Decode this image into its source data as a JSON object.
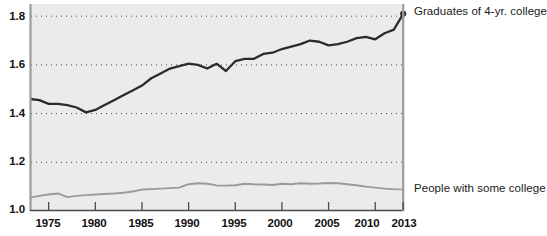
{
  "chart_data": {
    "type": "line",
    "title": "",
    "subtitle": "",
    "xlabel": "",
    "ylabel": "",
    "xlim": [
      1973,
      2013
    ],
    "ylim": [
      1.0,
      1.85
    ],
    "yticks": [
      "1.0",
      "1.2",
      "1.4",
      "1.6",
      "1.8"
    ],
    "ytick_values": [
      1.0,
      1.2,
      1.4,
      1.6,
      1.8
    ],
    "xticks": [
      "1975",
      "1980",
      "1985",
      "1990",
      "1995",
      "2000",
      "2005",
      "2010",
      "2013"
    ],
    "xtick_values": [
      1975,
      1980,
      1985,
      1990,
      1995,
      2000,
      2005,
      2010,
      2013
    ],
    "grid": "horizontal-dotted",
    "legend_position": "right-inline-end-of-series",
    "plot_background": "#ebebeb",
    "series": [
      {
        "name": "Graduates of 4-yr. college",
        "color": "#2b2b2b",
        "end_marker": true,
        "x": [
          1973,
          1974,
          1975,
          1976,
          1977,
          1978,
          1979,
          1980,
          1981,
          1982,
          1983,
          1984,
          1985,
          1986,
          1987,
          1988,
          1989,
          1990,
          1991,
          1992,
          1993,
          1994,
          1995,
          1996,
          1997,
          1998,
          1999,
          2000,
          2001,
          2002,
          2003,
          2004,
          2005,
          2006,
          2007,
          2008,
          2009,
          2010,
          2011,
          2012,
          2013
        ],
        "values": [
          1.46,
          1.455,
          1.44,
          1.44,
          1.435,
          1.425,
          1.405,
          1.415,
          1.435,
          1.455,
          1.475,
          1.495,
          1.515,
          1.545,
          1.565,
          1.585,
          1.595,
          1.605,
          1.6,
          1.585,
          1.605,
          1.575,
          1.615,
          1.625,
          1.625,
          1.645,
          1.65,
          1.665,
          1.675,
          1.685,
          1.7,
          1.695,
          1.68,
          1.685,
          1.695,
          1.71,
          1.715,
          1.705,
          1.73,
          1.745,
          1.81
        ]
      },
      {
        "name": "People with some college",
        "color": "#9a9a9a",
        "end_marker": false,
        "x": [
          1973,
          1974,
          1975,
          1976,
          1977,
          1978,
          1979,
          1980,
          1981,
          1982,
          1983,
          1984,
          1985,
          1986,
          1987,
          1988,
          1989,
          1990,
          1991,
          1992,
          1993,
          1994,
          1995,
          1996,
          1997,
          1998,
          1999,
          2000,
          2001,
          2002,
          2003,
          2004,
          2005,
          2006,
          2007,
          2008,
          2009,
          2010,
          2011,
          2012,
          2013
        ],
        "values": [
          1.055,
          1.062,
          1.068,
          1.072,
          1.057,
          1.062,
          1.065,
          1.068,
          1.07,
          1.072,
          1.075,
          1.08,
          1.088,
          1.09,
          1.092,
          1.094,
          1.096,
          1.11,
          1.114,
          1.112,
          1.105,
          1.104,
          1.106,
          1.112,
          1.11,
          1.109,
          1.107,
          1.112,
          1.11,
          1.114,
          1.112,
          1.113,
          1.115,
          1.114,
          1.11,
          1.106,
          1.1,
          1.096,
          1.092,
          1.09,
          1.089
        ]
      }
    ]
  },
  "axis": {
    "y_tick_labels": [
      "1.8",
      "1.6",
      "1.4",
      "1.2",
      "1.0"
    ],
    "x_tick_labels": [
      "1975",
      "1980",
      "1985",
      "1990",
      "1995",
      "2000",
      "2005",
      "2010",
      "2013"
    ]
  },
  "legend": {
    "top_label": "Graduates of 4-yr. college",
    "bottom_label": "People with some college"
  }
}
